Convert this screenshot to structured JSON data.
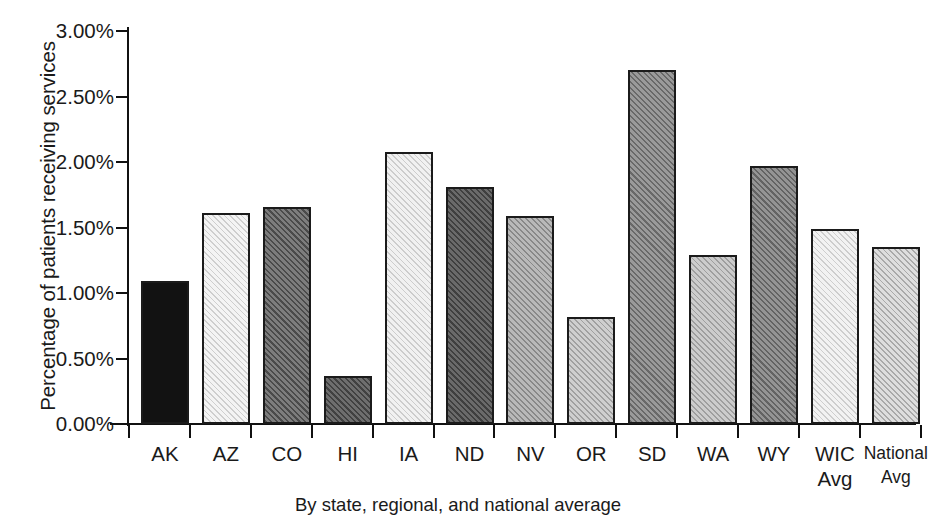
{
  "chart_data": {
    "type": "bar",
    "title": "",
    "xlabel": "By state, regional, and national average",
    "ylabel": "Percentage of patients receiving services",
    "categories": [
      "AK",
      "AZ",
      "CO",
      "HI",
      "IA",
      "ND",
      "NV",
      "OR",
      "SD",
      "WA",
      "WY",
      "WIC\nAvg",
      "National\nAvg"
    ],
    "category_labels": [
      "AK",
      "AZ",
      "CO",
      "HI",
      "IA",
      "ND",
      "NV",
      "OR",
      "SD",
      "WA",
      "WIC Avg",
      "National Avg"
    ],
    "values": [
      1.09,
      1.61,
      1.66,
      0.37,
      2.08,
      1.81,
      1.59,
      0.82,
      2.7,
      1.29,
      1.97,
      1.49,
      1.35
    ],
    "value_labels": [
      "1.09%",
      "1.61%",
      "1.66%",
      "0.37%",
      "2.08%",
      "1.81%",
      "1.59%",
      "0.82%",
      "2.70%",
      "1.29%",
      "1.97%",
      "1.49%",
      "1.35%"
    ],
    "ylim": [
      0,
      3.0
    ],
    "ytick_values": [
      0.0,
      0.5,
      1.0,
      1.5,
      2.0,
      2.5,
      3.0
    ],
    "ytick_labels": [
      "0.00%",
      "0.50%",
      "1.00%",
      "1.50%",
      "2.00%",
      "2.50%",
      "3.00%"
    ],
    "grid": false,
    "legend": false,
    "bar_fills": [
      {
        "name": "AK",
        "style": "solid-black",
        "color": "#121212"
      },
      {
        "name": "AZ",
        "style": "diagonal-hatch-very-light",
        "color": "#f4f4f4"
      },
      {
        "name": "CO",
        "style": "diagonal-hatch-dark",
        "color": "#7d7d7d"
      },
      {
        "name": "HI",
        "style": "diagonal-hatch-dark-gray",
        "color": "#6e6e6e"
      },
      {
        "name": "IA",
        "style": "diagonal-hatch-very-light",
        "color": "#f1f1f1"
      },
      {
        "name": "ND",
        "style": "diagonal-hatch-dark-gray",
        "color": "#6a6a6a"
      },
      {
        "name": "NV",
        "style": "diagonal-hatch-light-gray",
        "color": "#b9b9b9"
      },
      {
        "name": "OR",
        "style": "diagonal-hatch-light",
        "color": "#cfcfcf"
      },
      {
        "name": "SD",
        "style": "diagonal-hatch-medium",
        "color": "#9a9a9a"
      },
      {
        "name": "WA",
        "style": "diagonal-hatch-light",
        "color": "#cccccc"
      },
      {
        "name": "WY",
        "style": "diagonal-hatch-medium-gray",
        "color": "#949494"
      },
      {
        "name": "WIC Avg",
        "style": "diagonal-hatch-very-light",
        "color": "#f2f2f2"
      },
      {
        "name": "National Avg",
        "style": "diagonal-hatch-light",
        "color": "#dedede"
      }
    ],
    "axis_color": "#111111",
    "text_color": "#1a1a1a",
    "background": "#ffffff"
  },
  "axis": {
    "y_title": "Percentage of patients receiving services",
    "x_title": "By state, regional, and national average"
  }
}
